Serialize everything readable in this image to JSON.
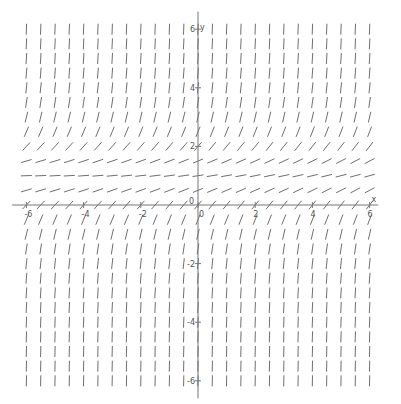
{
  "chart_data": {
    "type": "slope_field",
    "title": "",
    "xlabel": "x",
    "ylabel": "y",
    "xlim": [
      -6.3,
      6.3
    ],
    "ylim": [
      -6.4,
      6.4
    ],
    "grid": false,
    "x_ticks": [
      -6,
      -4,
      -2,
      0,
      2,
      4,
      6
    ],
    "y_ticks": [
      -6,
      -4,
      -2,
      0,
      2,
      4,
      6
    ],
    "x_tick_labels": [
      "-6",
      "-4",
      "-2",
      "0",
      "2",
      "4",
      "6"
    ],
    "y_tick_labels": [
      "-6",
      "-4",
      "-2",
      "0",
      "2",
      "4",
      "6"
    ],
    "field": {
      "description": "slope ≈ (y - 1)^2 + 0.15 + 0.02x; flattest near y ≈ 1, steep positive slopes elsewhere",
      "center_y": 1.0,
      "offset": 0.15,
      "x_coeff": 0.02,
      "x_range": [
        -6,
        6
      ],
      "y_range": [
        -6,
        6
      ],
      "step": 0.5,
      "segment_length_px": 11
    }
  },
  "axes": {
    "x_label": "x",
    "y_label": "y",
    "origin_label": "0"
  },
  "colors": {
    "axis": "#777777",
    "segment": "#6f6f6f",
    "text": "#555555",
    "background": "#ffffff"
  },
  "layout": {
    "origin_px": [
      198,
      205
    ],
    "px_per_unit_x": 28.6,
    "px_per_unit_y": 29.3
  }
}
